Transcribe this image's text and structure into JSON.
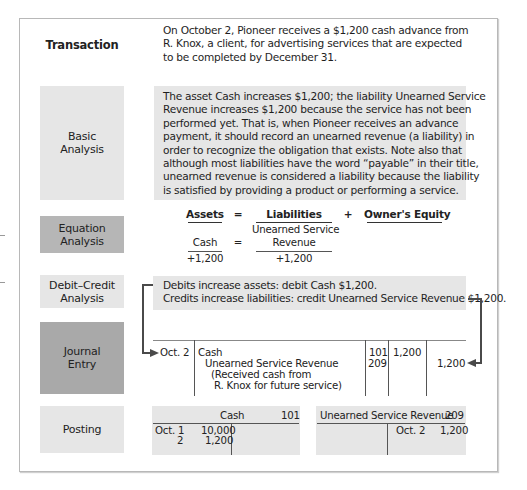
{
  "rows": {
    "transaction": {
      "label": "Transaction",
      "lines": [
        "On October 2, Pioneer receives a $1,200 cash advance from",
        "R. Knox, a client, for advertising services that are expected",
        "to be completed by December 31."
      ]
    },
    "basic_analysis": {
      "label_line1": "Basic",
      "label_line2": "Analysis",
      "lines": [
        "The asset Cash increases $1,200; the liability Unearned Service",
        "Revenue increases $1,200 because the service has not been",
        "performed yet. That is, when Pioneer receives an advance",
        "payment, it should record an unearned revenue (a liability) in",
        "order to recognize the obligation that exists. Note also that",
        "although most liabilities have the word “payable” in their title,",
        "unearned revenue is considered a liability because the liability",
        "is satisfied by providing a product or performing a service."
      ]
    },
    "equation_analysis": {
      "label_line1": "Equation",
      "label_line2": "Analysis",
      "headers": {
        "assets": "Assets",
        "equals": "=",
        "liabilities": "Liabilities",
        "plus": "+",
        "equity": "Owner's Equity"
      },
      "accounts": {
        "asset": "Cash",
        "equals": "=",
        "liability_line1": "Unearned Service",
        "liability_line2": "Revenue"
      },
      "amounts": {
        "asset": "+1,200",
        "liability": "+1,200"
      }
    },
    "debit_credit_analysis": {
      "label_line1": "Debit–Credit",
      "label_line2": "Analysis",
      "lines": [
        "Debits increase assets: debit Cash $1,200.",
        "Credits increase liabilities: credit Unearned Service Revenue $1,200."
      ]
    },
    "journal_entry": {
      "label_line1": "Journal",
      "label_line2": "Entry",
      "date": "Oct. 2",
      "debit_account": "Cash",
      "credit_account": "Unearned Service Revenue",
      "explanation_line1": "(Received cash from",
      "explanation_line2": "R. Knox for future service)",
      "debit_ref": "101",
      "credit_ref": "209",
      "debit_amount": "1,200",
      "credit_amount": "1,200"
    },
    "posting": {
      "label": "Posting",
      "cash_account": {
        "title": "Cash",
        "number": "101",
        "debits": [
          {
            "date": "Oct. 1",
            "amount": "10,000"
          },
          {
            "date": "2",
            "amount": "1,200"
          }
        ]
      },
      "unearned_account": {
        "title": "Unearned Service Revenue",
        "number": "209",
        "credits": [
          {
            "date": "Oct. 2",
            "amount": "1,200"
          }
        ]
      }
    }
  }
}
